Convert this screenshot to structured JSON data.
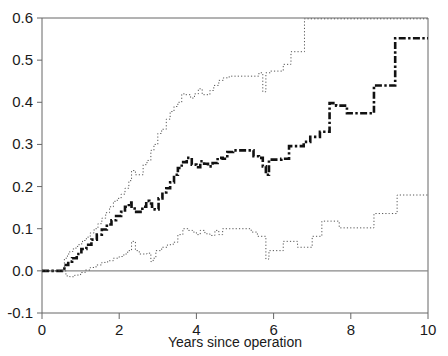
{
  "chart_data": {
    "type": "line",
    "subtype": "step",
    "title": "",
    "xlabel": "Years since operation",
    "ylabel": "",
    "xlim": [
      0,
      10
    ],
    "ylim": [
      -0.1,
      0.6
    ],
    "xticks": [
      0,
      2,
      4,
      6,
      8,
      10
    ],
    "xtick_labels": [
      "0",
      "2",
      "4",
      "6",
      "8",
      "10"
    ],
    "yticks": [
      -0.1,
      0.0,
      0.1,
      0.2,
      0.3,
      0.4,
      0.5,
      0.6
    ],
    "ytick_labels": [
      "-0.1",
      "0.0",
      "0.1",
      "0.2",
      "0.3",
      "0.4",
      "0.5",
      "0.6"
    ],
    "grid": false,
    "zero_reference_line": 0.0,
    "legend": null,
    "legend_position": "none",
    "frame": [
      "left",
      "top",
      "right",
      "bottom"
    ],
    "series": [
      {
        "name": "Upper confidence limit",
        "style": "dotted",
        "color": "#555555",
        "linewidth": 1,
        "x": [
          0.0,
          0.5,
          0.58,
          0.66,
          0.72,
          0.8,
          0.88,
          0.96,
          1.05,
          1.15,
          1.25,
          1.35,
          1.45,
          1.55,
          1.65,
          1.75,
          1.85,
          1.95,
          2.05,
          2.15,
          2.25,
          2.32,
          2.42,
          2.5,
          2.62,
          2.72,
          2.82,
          2.9,
          3.0,
          3.1,
          3.22,
          3.32,
          3.42,
          3.52,
          3.62,
          3.72,
          3.85,
          3.95,
          4.05,
          4.15,
          4.25,
          4.35,
          4.45,
          4.58,
          4.7,
          4.85,
          5.05,
          5.25,
          5.45,
          5.62,
          5.72,
          5.8,
          5.92,
          6.1,
          6.25,
          6.45,
          6.65,
          6.8,
          7.0,
          10.0
        ],
        "y": [
          0.0,
          0.0,
          0.03,
          0.04,
          0.046,
          0.052,
          0.058,
          0.064,
          0.072,
          0.08,
          0.09,
          0.1,
          0.112,
          0.125,
          0.138,
          0.152,
          0.165,
          0.172,
          0.182,
          0.196,
          0.214,
          0.238,
          0.228,
          0.228,
          0.252,
          0.262,
          0.286,
          0.3,
          0.326,
          0.336,
          0.36,
          0.378,
          0.39,
          0.4,
          0.42,
          0.418,
          0.41,
          0.42,
          0.432,
          0.418,
          0.418,
          0.428,
          0.44,
          0.452,
          0.458,
          0.462,
          0.462,
          0.462,
          0.462,
          0.47,
          0.425,
          0.47,
          0.474,
          0.474,
          0.49,
          0.52,
          0.52,
          0.598,
          0.598,
          0.598
        ]
      },
      {
        "name": "Point estimate",
        "style": "dash-dot-bold",
        "color": "#111111",
        "linewidth": 2.6,
        "x": [
          0.0,
          0.5,
          0.58,
          0.68,
          0.78,
          0.9,
          1.02,
          1.15,
          1.28,
          1.42,
          1.55,
          1.68,
          1.8,
          1.92,
          2.05,
          2.15,
          2.25,
          2.32,
          2.4,
          2.5,
          2.6,
          2.7,
          2.78,
          2.85,
          2.92,
          3.02,
          3.12,
          3.22,
          3.32,
          3.42,
          3.52,
          3.62,
          3.75,
          3.88,
          4.0,
          4.1,
          4.2,
          4.3,
          4.42,
          4.55,
          4.68,
          4.8,
          4.95,
          5.1,
          5.3,
          5.48,
          5.62,
          5.72,
          5.8,
          5.88,
          6.05,
          6.2,
          6.4,
          6.62,
          6.78,
          6.95,
          7.2,
          7.45,
          7.62,
          7.9,
          8.3,
          8.6,
          9.0,
          9.15,
          10.0
        ],
        "y": [
          0.0,
          0.0,
          0.014,
          0.022,
          0.03,
          0.04,
          0.052,
          0.062,
          0.074,
          0.086,
          0.098,
          0.11,
          0.12,
          0.13,
          0.14,
          0.152,
          0.162,
          0.148,
          0.14,
          0.14,
          0.152,
          0.166,
          0.16,
          0.152,
          0.146,
          0.172,
          0.186,
          0.196,
          0.21,
          0.228,
          0.244,
          0.258,
          0.268,
          0.252,
          0.246,
          0.26,
          0.254,
          0.248,
          0.256,
          0.268,
          0.266,
          0.282,
          0.286,
          0.286,
          0.286,
          0.272,
          0.268,
          0.248,
          0.228,
          0.264,
          0.264,
          0.266,
          0.296,
          0.296,
          0.306,
          0.318,
          0.33,
          0.398,
          0.392,
          0.374,
          0.374,
          0.44,
          0.44,
          0.552,
          0.552
        ]
      },
      {
        "name": "Lower confidence limit",
        "style": "dotted",
        "color": "#555555",
        "linewidth": 1,
        "x": [
          0.0,
          0.52,
          0.62,
          0.72,
          0.85,
          1.0,
          1.12,
          1.25,
          1.4,
          1.55,
          1.7,
          1.85,
          2.0,
          2.12,
          2.22,
          2.32,
          2.42,
          2.52,
          2.62,
          2.72,
          2.82,
          2.88,
          2.95,
          3.1,
          3.25,
          3.4,
          3.52,
          3.65,
          3.78,
          3.9,
          4.0,
          4.1,
          4.22,
          4.35,
          4.48,
          4.58,
          4.68,
          4.85,
          5.05,
          5.25,
          5.42,
          5.58,
          5.72,
          5.8,
          5.88,
          6.05,
          6.25,
          6.45,
          6.62,
          6.8,
          7.0,
          7.25,
          7.5,
          7.7,
          7.95,
          8.3,
          8.6,
          9.0,
          9.2,
          10.0
        ],
        "y": [
          0.0,
          0.0,
          -0.012,
          -0.014,
          -0.01,
          -0.004,
          0.002,
          0.008,
          0.014,
          0.02,
          0.024,
          0.03,
          0.034,
          0.04,
          0.048,
          0.07,
          0.048,
          0.04,
          0.04,
          0.042,
          0.022,
          0.03,
          0.048,
          0.056,
          0.062,
          0.068,
          0.086,
          0.1,
          0.096,
          0.092,
          0.086,
          0.096,
          0.088,
          0.084,
          0.096,
          0.086,
          0.1,
          0.1,
          0.1,
          0.1,
          0.092,
          0.082,
          0.082,
          0.028,
          0.048,
          0.048,
          0.07,
          0.07,
          0.056,
          0.056,
          0.082,
          0.118,
          0.118,
          0.102,
          0.102,
          0.102,
          0.136,
          0.136,
          0.18,
          0.18
        ]
      }
    ]
  },
  "axes": {
    "x_title": "Years since operation"
  },
  "colors": {
    "frame": "#666666",
    "zero_line": "#888888",
    "estimate": "#111111",
    "confidence": "#555555",
    "background": "#ffffff"
  }
}
